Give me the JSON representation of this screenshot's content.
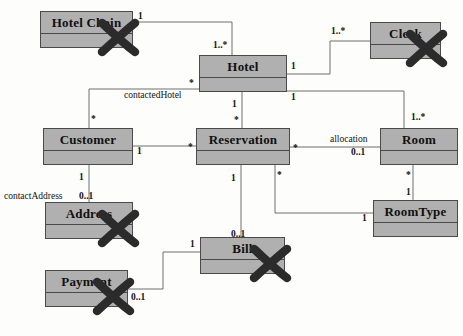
{
  "diagram": {
    "type": "uml-class-diagram",
    "background_color": "#fdfdfb",
    "class_fill_color": "#b0b0b0",
    "class_border_color": "#4a4a4a",
    "edge_color": "#6e6e6e",
    "strike_color": "#2b2b2b"
  },
  "classes": [
    {
      "id": "hotel-chain",
      "name": "Hotel Chain",
      "x": 40,
      "y": 11,
      "w": 93,
      "h": 37,
      "struck": true
    },
    {
      "id": "hotel",
      "name": "Hotel",
      "x": 199,
      "y": 55,
      "w": 88,
      "h": 37,
      "struck": false
    },
    {
      "id": "clerk",
      "name": "Clerk",
      "x": 370,
      "y": 22,
      "w": 71,
      "h": 37,
      "struck": true
    },
    {
      "id": "customer",
      "name": "Customer",
      "x": 43,
      "y": 128,
      "w": 90,
      "h": 37,
      "struck": false
    },
    {
      "id": "reservation",
      "name": "Reservation",
      "x": 196,
      "y": 128,
      "w": 94,
      "h": 37,
      "struck": false
    },
    {
      "id": "room",
      "name": "Room",
      "x": 380,
      "y": 128,
      "w": 78,
      "h": 37,
      "struck": false
    },
    {
      "id": "address",
      "name": "Address",
      "x": 45,
      "y": 202,
      "w": 88,
      "h": 37,
      "struck": true
    },
    {
      "id": "room-type",
      "name": "RoomType",
      "x": 373,
      "y": 200,
      "w": 85,
      "h": 37,
      "struck": false
    },
    {
      "id": "bill",
      "name": "Bill",
      "x": 200,
      "y": 237,
      "w": 85,
      "h": 37,
      "struck": true
    },
    {
      "id": "payment",
      "name": "Payment",
      "x": 45,
      "y": 270,
      "w": 83,
      "h": 37,
      "struck": true
    }
  ],
  "associations": [
    {
      "id": "hotelchain-hotel",
      "from": "hotel-chain",
      "to": "hotel",
      "points": "133,22 232,22 232,55",
      "labels": [
        {
          "text": "1",
          "x": 138,
          "y": 11
        },
        {
          "text": "1..*",
          "x": 213,
          "y": 40
        }
      ]
    },
    {
      "id": "hotel-clerk",
      "from": "hotel",
      "to": "clerk",
      "points": "287,74 330,74 330,41 370,41",
      "labels": [
        {
          "text": "1",
          "x": 291,
          "y": 61
        },
        {
          "text": "1..*",
          "x": 331,
          "y": 26
        }
      ]
    },
    {
      "id": "hotel-room",
      "from": "hotel",
      "to": "room",
      "points": "287,91 404,91 404,128",
      "labels": [
        {
          "text": "1",
          "x": 291,
          "y": 92
        },
        {
          "text": "1..*",
          "x": 411,
          "y": 112
        }
      ]
    },
    {
      "id": "contacted-hotel",
      "from": "hotel",
      "to": "customer",
      "points": "199,89 89,89 89,128",
      "labels": [
        {
          "text": "*",
          "x": 189,
          "y": 78
        },
        {
          "text": "*",
          "x": 91,
          "y": 114
        }
      ],
      "role": {
        "text": "contactedHotel",
        "x": 124,
        "y": 90
      }
    },
    {
      "id": "hotel-reservation",
      "from": "hotel",
      "to": "reservation",
      "points": "242,92 242,128",
      "labels": [
        {
          "text": "1",
          "x": 232,
          "y": 99
        },
        {
          "text": "*",
          "x": 234,
          "y": 115
        }
      ]
    },
    {
      "id": "customer-reservation",
      "from": "customer",
      "to": "reservation",
      "points": "133,146 196,146",
      "labels": [
        {
          "text": "1",
          "x": 137,
          "y": 146
        },
        {
          "text": "*",
          "x": 188,
          "y": 142
        }
      ]
    },
    {
      "id": "reservation-room",
      "from": "reservation",
      "to": "room",
      "points": "290,147 380,147",
      "labels": [
        {
          "text": "*",
          "x": 293,
          "y": 143
        },
        {
          "text": "0..1",
          "x": 351,
          "y": 147
        }
      ],
      "role": {
        "text": "allocation",
        "x": 330,
        "y": 134
      }
    },
    {
      "id": "room-roomtype",
      "from": "room",
      "to": "room-type",
      "points": "413,165 413,200",
      "labels": [
        {
          "text": "*",
          "x": 406,
          "y": 170
        },
        {
          "text": "1",
          "x": 406,
          "y": 187
        }
      ]
    },
    {
      "id": "reservation-roomtype",
      "from": "reservation",
      "to": "room-type",
      "points": "275,165 275,213 373,213",
      "labels": [
        {
          "text": "*",
          "x": 277,
          "y": 170
        },
        {
          "text": "1",
          "x": 362,
          "y": 213
        }
      ]
    },
    {
      "id": "reservation-bill",
      "from": "reservation",
      "to": "bill",
      "points": "241,165 241,237",
      "labels": [
        {
          "text": "1",
          "x": 231,
          "y": 173
        },
        {
          "text": "0..1",
          "x": 231,
          "y": 229
        }
      ]
    },
    {
      "id": "customer-address",
      "from": "customer",
      "to": "address",
      "points": "89,165 89,202",
      "labels": [
        {
          "text": "1",
          "x": 79,
          "y": 172
        },
        {
          "text": "0..1",
          "x": 79,
          "y": 191
        }
      ],
      "role": {
        "text": "contactAddress",
        "x": 4,
        "y": 191
      }
    },
    {
      "id": "payment-bill",
      "from": "payment",
      "to": "bill",
      "points": "128,289 163,289 163,252 200,252",
      "labels": [
        {
          "text": "0..1",
          "x": 131,
          "y": 292
        },
        {
          "text": "1",
          "x": 190,
          "y": 239
        }
      ]
    }
  ]
}
